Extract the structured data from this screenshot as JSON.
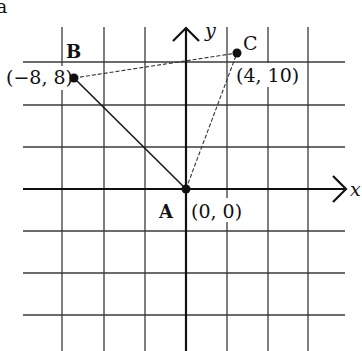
{
  "figure": {
    "panel_label": "a",
    "axes": {
      "x_label": "x",
      "y_label": "y"
    },
    "grid": {
      "cell_units": 2,
      "vertical_lines_px": [
        62,
        104,
        145,
        186,
        227,
        268,
        308
      ],
      "horizontal_lines_px": [
        62,
        105,
        147,
        189,
        231,
        273,
        315
      ]
    },
    "points": [
      {
        "name": "A",
        "coords": "(0, 0)"
      },
      {
        "name": "B",
        "coords": "(−8, 8)"
      },
      {
        "name": "C",
        "coords": "(4, 10)"
      }
    ],
    "segments": [
      {
        "from": "A",
        "to": "B",
        "style": "solid"
      },
      {
        "from": "B",
        "to": "C",
        "style": "dashed"
      },
      {
        "from": "A",
        "to": "C",
        "style": "dashed"
      }
    ]
  }
}
